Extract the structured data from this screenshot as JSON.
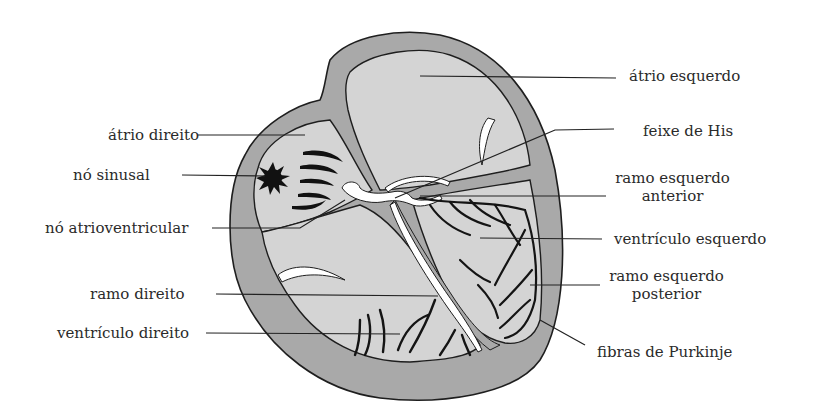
{
  "diagram": {
    "title": "",
    "colors": {
      "wall": "#a9a9a9",
      "chamber": "#d4d4d4",
      "outline": "#1e1e1e",
      "conduction": "#ffffff",
      "fibers": "#141414",
      "background": "#ffffff"
    },
    "labels_left": [
      {
        "id": "atrio-direito",
        "text": "átrio direito"
      },
      {
        "id": "no-sinusal",
        "text": "nó sinusal"
      },
      {
        "id": "no-atrioventricular",
        "text": "nó atrioventricular"
      },
      {
        "id": "ramo-direito",
        "text": "ramo direito"
      },
      {
        "id": "ventriculo-direito",
        "text": "ventrículo direito"
      }
    ],
    "labels_right": [
      {
        "id": "atrio-esquerdo",
        "text": "átrio esquerdo"
      },
      {
        "id": "feixe-de-his",
        "text": "feixe de His"
      },
      {
        "id": "ramo-esquerdo-anterior",
        "line1": "ramo esquerdo",
        "line2": "anterior"
      },
      {
        "id": "ventriculo-esquerdo",
        "text": "ventrículo esquerdo"
      },
      {
        "id": "ramo-esquerdo-posterior",
        "line1": "ramo esquerdo",
        "line2": "posterior"
      },
      {
        "id": "fibras-de-purkinje",
        "text": "fibras de Purkinje"
      }
    ]
  }
}
